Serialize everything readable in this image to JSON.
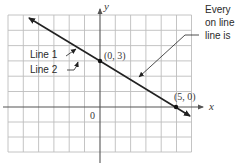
{
  "figure": {
    "axis_labels": {
      "x": "x",
      "y": "y"
    },
    "origin_label": "0",
    "points": [
      {
        "label": "(0, 3)",
        "x": 0,
        "y": 3
      },
      {
        "label": "(5, 0)",
        "x": 5,
        "y": 0
      }
    ],
    "line_labels": {
      "line1": "Line 1",
      "line2": "Line 2"
    },
    "annotation": [
      "Every",
      "on line",
      "line is"
    ],
    "grid": {
      "x_min": -6,
      "x_max": 6,
      "y_min": -3,
      "y_max": 6,
      "step": 1
    },
    "colors": {
      "grid": "#b8b8b8",
      "axis": "#555555",
      "line": "#222222"
    }
  }
}
